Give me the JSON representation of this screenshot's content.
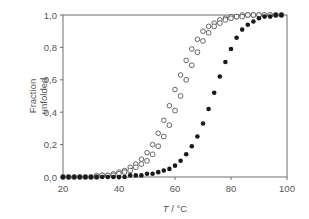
{
  "chart_data": {
    "type": "scatter",
    "title": "",
    "xlabel": "T / °C",
    "xlabel_italic_part": "T",
    "xlabel_unit": " / °C",
    "ylabel": "Fraction unfolded",
    "ylabel_lines": [
      "Fraction",
      "unfolded"
    ],
    "xlim": [
      20,
      100
    ],
    "ylim": [
      0,
      1.0
    ],
    "x_ticks": [
      20,
      40,
      60,
      80,
      100
    ],
    "x_tick_labels": [
      "20",
      "40",
      "60",
      "80",
      "100"
    ],
    "y_ticks": [
      0,
      0.2,
      0.4,
      0.6,
      0.8,
      1.0
    ],
    "y_tick_labels": [
      "0,0",
      "0,2",
      "0,4",
      "0,6",
      "0,8",
      "1,0"
    ],
    "grid": false,
    "legend": null,
    "series": [
      {
        "name": "open circles",
        "marker": "open-circle",
        "color": "#555555",
        "tm": 62.5,
        "x": [
          20,
          22,
          24,
          26,
          28,
          30,
          32,
          34,
          36,
          38,
          40,
          42,
          44,
          46,
          48,
          50,
          52,
          54,
          56,
          58,
          60,
          62,
          64,
          66,
          68,
          70,
          72,
          74,
          76,
          78,
          80,
          82,
          84,
          86,
          88,
          90,
          92,
          94,
          96,
          98
        ],
        "values": [
          0.0,
          0.0,
          0.0,
          0.0,
          0.0,
          0.0,
          0.01,
          0.01,
          0.01,
          0.02,
          0.03,
          0.04,
          0.06,
          0.08,
          0.11,
          0.15,
          0.2,
          0.27,
          0.35,
          0.44,
          0.54,
          0.63,
          0.72,
          0.79,
          0.85,
          0.9,
          0.93,
          0.95,
          0.97,
          0.98,
          0.99,
          0.99,
          1.0,
          1.0,
          1.0,
          1.0,
          1.0,
          1.0,
          1.0,
          1.0
        ]
      },
      {
        "name": "open squares",
        "marker": "open-square",
        "color": "#555555",
        "tm": 65,
        "x": [
          20,
          22,
          24,
          26,
          28,
          30,
          32,
          34,
          36,
          38,
          40,
          42,
          44,
          46,
          48,
          50,
          52,
          54,
          56,
          58,
          60,
          62,
          64,
          66,
          68,
          70,
          72,
          74,
          76,
          78,
          80,
          82,
          84,
          86,
          88,
          90,
          92,
          94,
          96,
          98
        ],
        "values": [
          0.0,
          0.0,
          0.0,
          0.0,
          0.0,
          0.0,
          0.0,
          0.01,
          0.01,
          0.01,
          0.02,
          0.03,
          0.04,
          0.06,
          0.08,
          0.1,
          0.14,
          0.19,
          0.25,
          0.32,
          0.41,
          0.5,
          0.6,
          0.69,
          0.77,
          0.84,
          0.89,
          0.93,
          0.95,
          0.97,
          0.98,
          0.99,
          0.99,
          1.0,
          1.0,
          1.0,
          1.0,
          1.0,
          1.0,
          1.0
        ]
      },
      {
        "name": "filled circles",
        "marker": "filled-circle",
        "color": "#1a1a1a",
        "tm": 75,
        "x": [
          20,
          22,
          24,
          26,
          28,
          30,
          32,
          34,
          36,
          38,
          40,
          42,
          44,
          46,
          48,
          50,
          52,
          54,
          56,
          58,
          60,
          62,
          64,
          66,
          68,
          70,
          72,
          74,
          76,
          78,
          80,
          82,
          84,
          86,
          88,
          90,
          92,
          94,
          96,
          98
        ],
        "values": [
          0.0,
          0.0,
          0.0,
          0.0,
          0.0,
          0.0,
          0.0,
          0.0,
          0.0,
          0.0,
          0.0,
          0.0,
          0.01,
          0.01,
          0.01,
          0.02,
          0.02,
          0.03,
          0.04,
          0.05,
          0.07,
          0.1,
          0.14,
          0.19,
          0.25,
          0.33,
          0.42,
          0.52,
          0.62,
          0.71,
          0.79,
          0.86,
          0.91,
          0.94,
          0.96,
          0.98,
          0.99,
          0.99,
          1.0,
          1.0
        ]
      }
    ]
  },
  "colors": {
    "axis": "#6e6e6e",
    "text": "#555555",
    "open_marker": "#555555",
    "filled_marker": "#1a1a1a"
  }
}
